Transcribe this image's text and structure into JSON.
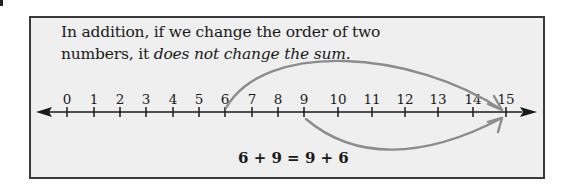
{
  "label": {
    "intro_line1": "In addition, if we change the order of two",
    "intro_line2_plain": "numbers, it ",
    "intro_line2_italic": "does not change the sum",
    "intro_line2_end": "."
  },
  "number_line": {
    "min": 0,
    "max": 15,
    "ticks": [
      "0",
      "1",
      "2",
      "3",
      "4",
      "5",
      "6",
      "7",
      "8",
      "9",
      "10",
      "11",
      "12",
      "13",
      "14",
      "15"
    ],
    "line_color": "#1a1a1a"
  },
  "jumps": [
    {
      "name": "jump-6-plus-9",
      "from": 6,
      "to": 15,
      "side": "above",
      "color": "#8c8c8c"
    },
    {
      "name": "jump-9-plus-6",
      "from": 9,
      "to": 15,
      "side": "below",
      "color": "#8c8c8c"
    }
  ],
  "equation": "6 + 9 = 9 + 6",
  "colors": {
    "panel_bg": "#efefef",
    "panel_border": "#3a3a3a",
    "arc": "#8c8c8c",
    "text": "#1a1a1a"
  }
}
